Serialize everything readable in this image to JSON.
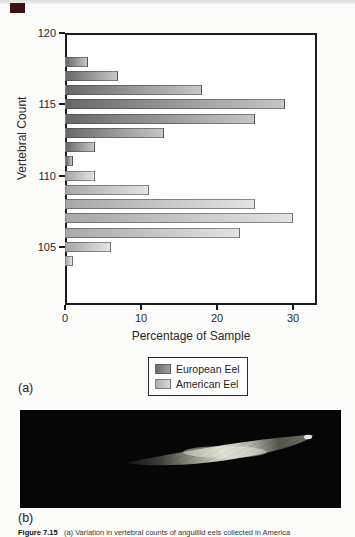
{
  "labels": {
    "panel_a": "(a)",
    "panel_b": "(b)"
  },
  "caption": {
    "figure_label": "Figure 7.15",
    "text": "(a) Variation in vertebral counts of anguillid eels collected in America"
  },
  "legend": {
    "items": [
      {
        "label": "European Eel",
        "color_start": "#6c6c6c",
        "color_end": "#9d9d9d"
      },
      {
        "label": "American Eel",
        "color_start": "#aeaeae",
        "color_end": "#d8d8d8"
      }
    ]
  },
  "chart_data": {
    "type": "bar",
    "orientation": "horizontal",
    "title": "",
    "xlabel": "Percentage of Sample",
    "ylabel": "Vertebral Count",
    "xlim": [
      0,
      33
    ],
    "ylim": [
      101,
      120
    ],
    "xticks": [
      0,
      10,
      20,
      30
    ],
    "yticks": [
      120,
      115,
      110,
      105
    ],
    "grid": false,
    "legend_position": "below",
    "series": [
      {
        "name": "European Eel",
        "color_start": "#686868",
        "color_end": "#c6c6c6",
        "points": [
          {
            "count": 118,
            "pct": 3
          },
          {
            "count": 117,
            "pct": 7
          },
          {
            "count": 116,
            "pct": 18
          },
          {
            "count": 115,
            "pct": 29
          },
          {
            "count": 114,
            "pct": 25
          },
          {
            "count": 113,
            "pct": 13
          },
          {
            "count": 112,
            "pct": 4
          },
          {
            "count": 111,
            "pct": 1
          }
        ]
      },
      {
        "name": "American Eel",
        "color_start": "#a8a8a8",
        "color_end": "#e3e3e3",
        "points": [
          {
            "count": 110,
            "pct": 4
          },
          {
            "count": 109,
            "pct": 11
          },
          {
            "count": 108,
            "pct": 25
          },
          {
            "count": 107,
            "pct": 30
          },
          {
            "count": 106,
            "pct": 23
          },
          {
            "count": 105,
            "pct": 6
          },
          {
            "count": 104,
            "pct": 1
          }
        ]
      }
    ]
  },
  "colors": {
    "frame": "#1c1c1c",
    "photo_background": "#060606",
    "page_background": "#fbfbfa",
    "corner_mark": "#3d1114"
  }
}
